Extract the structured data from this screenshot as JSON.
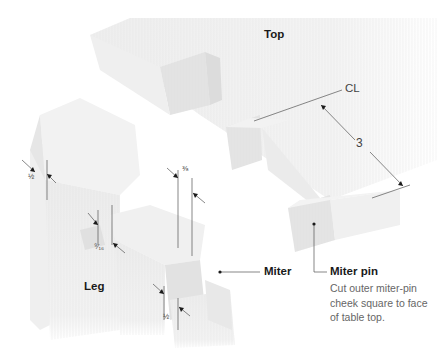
{
  "diagram": {
    "labels": {
      "top": "Top",
      "leg": "Leg",
      "miter": "Miter",
      "centerline": "CL",
      "miter_pin": "Miter pin"
    },
    "dimensions": {
      "pin_spacing": "3",
      "leg_side_thickness": "½",
      "slot_width": "⁹⁄₁₆",
      "pin_offset_top": "⅜",
      "pin_offset_bottom": "½"
    },
    "notes": {
      "miter_pin_line1": "Cut outer miter-pin",
      "miter_pin_line2": "cheek square to face",
      "miter_pin_line3": "of table top."
    },
    "colors": {
      "wood_light": "#f4f4f4",
      "wood_mid": "#e8e8e8",
      "wood_dark": "#d9d9d9",
      "line": "#555555",
      "text": "#1a1a1a",
      "note_text": "#666666"
    }
  }
}
